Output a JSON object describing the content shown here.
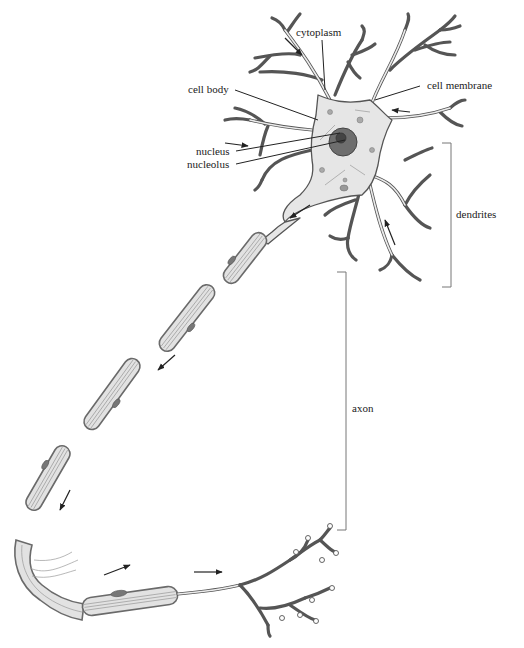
{
  "diagram": {
    "labels": {
      "cytoplasm": "cytoplasm",
      "cell_body": "cell body",
      "cell_membrane": "cell membrane",
      "nucleus": "nucleus",
      "nucleolus": "nucleolus",
      "dendrites": "dendrites",
      "axon": "axon"
    },
    "colors": {
      "outline": "#555555",
      "fill": "#e6e6e6",
      "nucleus": "#6e6e6e",
      "label_text": "#222222",
      "bracket": "#777777"
    }
  }
}
